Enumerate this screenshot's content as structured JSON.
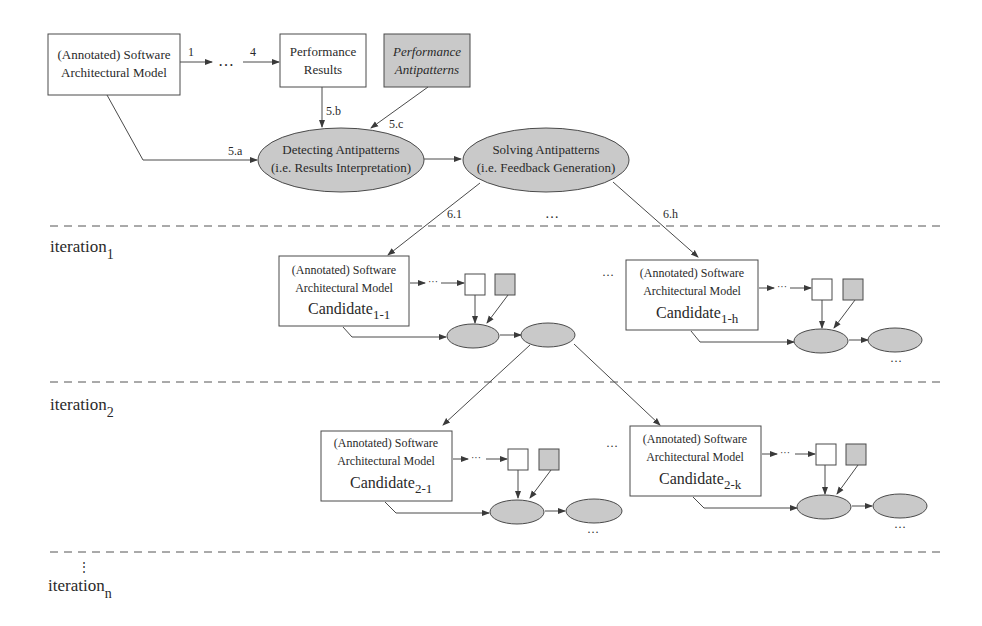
{
  "colors": {
    "stroke": "#4a4a4a",
    "gray_fill": "#c9c9c9",
    "white_fill": "#ffffff",
    "dashed": "#555555"
  },
  "top": {
    "model_box": {
      "line1": "(Annotated) Software",
      "line2": "Architectural Model"
    },
    "results_box": {
      "line1": "Performance",
      "line2": "Results"
    },
    "antipatterns_box": {
      "line1": "Performance",
      "line2": "Antipatterns"
    },
    "step_labels": {
      "s1": "1",
      "s4": "4",
      "dots": "…",
      "s5a": "5.a",
      "s5b": "5.b",
      "s5c": "5.c",
      "s61": "6.1",
      "s6h": "6.h",
      "mid_dots": "…"
    },
    "detecting": {
      "line1": "Detecting Antipatterns",
      "line2": "(i.e. Results Interpretation)"
    },
    "solving": {
      "line1": "Solving Antipatterns",
      "line2": "(i.e. Feedback Generation)"
    }
  },
  "iterations": [
    {
      "label": "iteration",
      "sub": "1"
    },
    {
      "label": "iteration",
      "sub": "2"
    },
    {
      "label": "iteration",
      "sub": "n"
    }
  ],
  "candidates": [
    {
      "line1": "(Annotated) Software",
      "line2": "Architectural Model",
      "name": "Candidate",
      "sub": "1-1"
    },
    {
      "line1": "(Annotated) Software",
      "line2": "Architectural Model",
      "name": "Candidate",
      "sub": "1-h"
    },
    {
      "line1": "(Annotated) Software",
      "line2": "Architectural Model",
      "name": "Candidate",
      "sub": "2-1"
    },
    {
      "line1": "(Annotated) Software",
      "line2": "Architectural Model",
      "name": "Candidate",
      "sub": "2-k"
    }
  ],
  "ellipsis": "…",
  "small_dots": "···",
  "vertical_dots": "⋮"
}
